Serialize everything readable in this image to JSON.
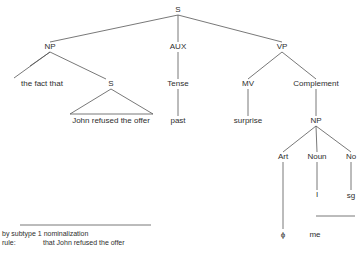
{
  "tree": {
    "nodes": {
      "root_s": "S",
      "np": "NP",
      "aux": "AUX",
      "vp": "VP",
      "the_fact_that": "the fact that",
      "embedded_s": "S",
      "tense": "Tense",
      "mv": "MV",
      "complement": "Complement",
      "embedded_text": "John refused the offer",
      "past": "past",
      "surprise": "surprise",
      "comp_np": "NP",
      "art": "Art",
      "noun": "Noun",
      "no": "No",
      "noun_value": "I",
      "no_value": "sg",
      "art_value": "ϕ",
      "pronoun_form": "me"
    }
  },
  "footnote": {
    "line1": "by subtype 1 nominalization",
    "rule_label": "rule:",
    "rule_value": "that John refused the offer"
  },
  "colors": {
    "line": "#444444",
    "text": "#2e2e2e"
  }
}
